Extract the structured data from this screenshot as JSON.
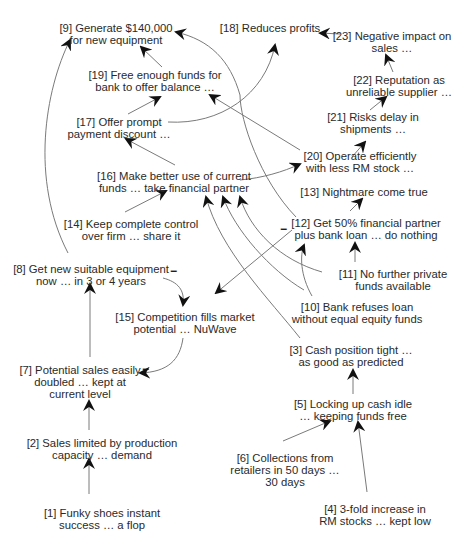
{
  "diagram": {
    "type": "cognitive-map",
    "nodes": [
      {
        "id": "1",
        "lines": [
          "[1] Funky shoes instant",
          "success … a flop"
        ],
        "x": 102,
        "y": 507
      },
      {
        "id": "2",
        "lines": [
          "[2] Sales limited by production",
          "capacity … demand"
        ],
        "x": 102,
        "y": 437
      },
      {
        "id": "7",
        "lines": [
          "[7] Potential sales easily",
          "doubled … kept at",
          "current level"
        ],
        "x": 80,
        "y": 370
      },
      {
        "id": "8",
        "lines": [
          "[8] Get new suitable equipment",
          "now … in 3 or 4 years"
        ],
        "x": 91,
        "y": 266
      },
      {
        "id": "15",
        "lines": [
          "[15] Competition fills market",
          "potential … NuWave"
        ],
        "x": 185,
        "y": 313
      },
      {
        "id": "14",
        "lines": [
          "[14] Keep complete control",
          "over firm … share it"
        ],
        "x": 131,
        "y": 219
      },
      {
        "id": "16",
        "lines": [
          "[16] Make better use of current",
          "funds … take financial partner"
        ],
        "x": 174,
        "y": 172
      },
      {
        "id": "17",
        "lines": [
          "[17] Offer prompt",
          "payment discount …"
        ],
        "x": 119,
        "y": 116
      },
      {
        "id": "19",
        "lines": [
          "[19] Free enough funds for",
          "bank to offer balance …"
        ],
        "x": 155,
        "y": 69
      },
      {
        "id": "9",
        "lines": [
          "[9] Generate $140,000",
          "for new equipment"
        ],
        "x": 116,
        "y": 22
      },
      {
        "id": "18",
        "lines": [
          "[18] Reduces profits"
        ],
        "x": 270,
        "y": 22
      },
      {
        "id": "23",
        "lines": [
          "[23] Negative impact on",
          "sales …"
        ],
        "x": 392,
        "y": 30
      },
      {
        "id": "22",
        "lines": [
          "[22] Reputation as",
          "unreliable supplier …"
        ],
        "x": 399,
        "y": 75
      },
      {
        "id": "21",
        "lines": [
          "[21] Risks delay in",
          "shipments …"
        ],
        "x": 373,
        "y": 112
      },
      {
        "id": "20",
        "lines": [
          "[20] Operate efficiently",
          "with less RM stock …"
        ],
        "x": 360,
        "y": 150
      },
      {
        "id": "13",
        "lines": [
          "[13] Nightmare come true"
        ],
        "x": 364,
        "y": 185
      },
      {
        "id": "12",
        "lines": [
          "[12] Get 50% financial partner",
          "plus bank loan … do nothing"
        ],
        "x": 366,
        "y": 217
      },
      {
        "id": "11",
        "lines": [
          "[11] No further private",
          "funds available"
        ],
        "x": 393,
        "y": 268
      },
      {
        "id": "10",
        "lines": [
          "[10] Bank refuses loan",
          "without equal equity funds"
        ],
        "x": 357,
        "y": 300
      },
      {
        "id": "3",
        "lines": [
          "[3] Cash position tight …",
          "as good as predicted"
        ],
        "x": 351,
        "y": 344
      },
      {
        "id": "5",
        "lines": [
          "[5] Locking up cash idle",
          "… keeping funds free"
        ],
        "x": 353,
        "y": 401
      },
      {
        "id": "6",
        "lines": [
          "[6] Collections from",
          "retailers in 50 days …",
          "30 days"
        ],
        "x": 275,
        "y": 453
      },
      {
        "id": "4",
        "lines": [
          "[4] 3-fold increase in",
          "RM stocks … kept low"
        ],
        "x": 375,
        "y": 505
      }
    ],
    "edges": [
      {
        "from": "1",
        "to": "2",
        "sign": "+"
      },
      {
        "from": "2",
        "to": "7",
        "sign": "+"
      },
      {
        "from": "7",
        "to": "8",
        "sign": "+"
      },
      {
        "from": "8",
        "to": "9",
        "sign": "+"
      },
      {
        "from": "8",
        "to": "15",
        "sign": "-"
      },
      {
        "from": "15",
        "to": "7",
        "sign": "-"
      },
      {
        "from": "14",
        "to": "16",
        "sign": "+"
      },
      {
        "from": "16",
        "to": "17",
        "sign": "+"
      },
      {
        "from": "16",
        "to": "20",
        "sign": "+"
      },
      {
        "from": "17",
        "to": "19",
        "sign": "+"
      },
      {
        "from": "17",
        "to": "18",
        "sign": "+"
      },
      {
        "from": "19",
        "to": "9",
        "sign": "+"
      },
      {
        "from": "20",
        "to": "19",
        "sign": "+"
      },
      {
        "from": "20",
        "to": "21",
        "sign": "+"
      },
      {
        "from": "21",
        "to": "22",
        "sign": "+"
      },
      {
        "from": "22",
        "to": "23",
        "sign": "+"
      },
      {
        "from": "23",
        "to": "18",
        "sign": "+"
      },
      {
        "from": "12",
        "to": "9",
        "sign": "+"
      },
      {
        "from": "12",
        "to": "13",
        "sign": "+"
      },
      {
        "from": "12",
        "to": "15",
        "sign": "-"
      },
      {
        "from": "11",
        "to": "12",
        "sign": "+"
      },
      {
        "from": "10",
        "to": "12",
        "sign": "+"
      },
      {
        "from": "11",
        "to": "16",
        "sign": "+"
      },
      {
        "from": "10",
        "to": "16",
        "sign": "+"
      },
      {
        "from": "3",
        "to": "16",
        "sign": "+"
      },
      {
        "from": "5",
        "to": "3",
        "sign": "+"
      },
      {
        "from": "6",
        "to": "5",
        "sign": "+"
      },
      {
        "from": "4",
        "to": "5",
        "sign": "+"
      }
    ],
    "signs": [
      {
        "label": "−",
        "x": 171,
        "y": 270
      },
      {
        "label": "−",
        "x": 144,
        "y": 368
      },
      {
        "label": "−",
        "x": 282,
        "y": 225
      }
    ],
    "colors": {
      "text": "#2a2a2a",
      "edge": "#7a7a7a",
      "arrowhead": "#111111",
      "background": "#ffffff"
    }
  }
}
